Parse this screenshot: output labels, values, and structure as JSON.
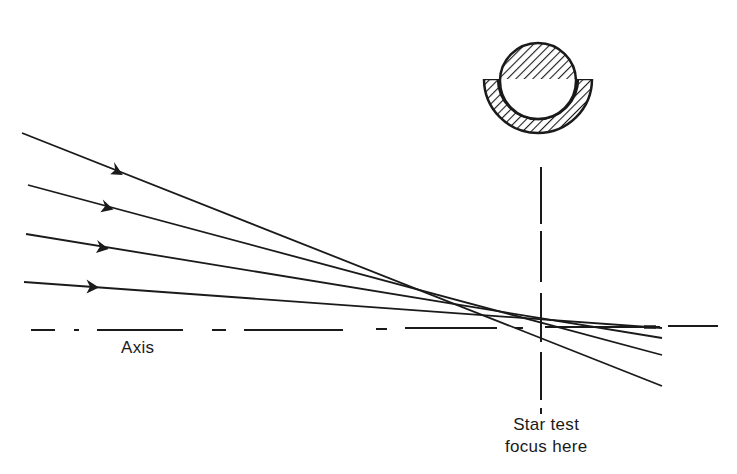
{
  "diagram": {
    "type": "optics-ray-diagram",
    "labels": {
      "axis": "Axis",
      "focus_line1": "Star test",
      "focus_line2": "focus here"
    },
    "star_image_icon": "hatched-disk-with-crescent-ring",
    "rays": [
      {
        "from": [
          22,
          133
        ],
        "to": [
          662,
          386
        ],
        "arrow_at": [
          118,
          171
        ]
      },
      {
        "from": [
          28,
          185
        ],
        "to": [
          662,
          355
        ],
        "arrow_at": [
          108,
          207
        ]
      },
      {
        "from": [
          26,
          234
        ],
        "to": [
          662,
          338
        ],
        "arrow_at": [
          103,
          247
        ]
      },
      {
        "from": [
          24,
          282
        ],
        "to": [
          662,
          328
        ],
        "arrow_at": [
          93,
          287
        ]
      }
    ],
    "colors": {
      "ink": "#1a1a1a",
      "background": "#ffffff"
    }
  }
}
